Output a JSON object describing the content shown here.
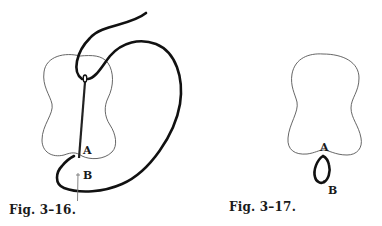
{
  "figures": [
    {
      "id": "fig-3-16",
      "caption": "Fig. 3–16.",
      "labels": {
        "a": "A",
        "b": "B"
      },
      "description": "Needle inserted down through fabric piece from eye near top to point A at bottom edge; thick thread loops around to exit at B"
    },
    {
      "id": "fig-3-17",
      "caption": "Fig. 3–17.",
      "labels": {
        "a": "A",
        "b": "B"
      },
      "description": "Fabric piece with small thread loop formed between points A and B at bottom edge"
    }
  ],
  "colors": {
    "outline": "#555555",
    "thread": "#111111",
    "text": "#1a1a1a",
    "background": "#ffffff"
  }
}
